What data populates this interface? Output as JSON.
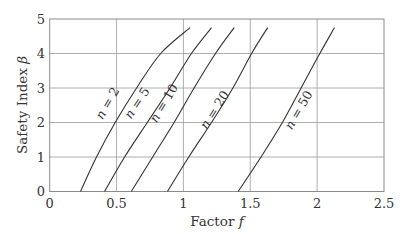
{
  "chart_data": {
    "type": "line",
    "title": "",
    "xlabel": "Factor f",
    "ylabel": "Safety Index β",
    "xlim": [
      0,
      2.5
    ],
    "ylim": [
      0,
      5
    ],
    "xticks": [
      0,
      0.5,
      1,
      1.5,
      2,
      2.5
    ],
    "xtick_labels": [
      "0",
      "0.5",
      "1",
      "1.5",
      "2",
      "2.5"
    ],
    "yticks": [
      0,
      1,
      2,
      3,
      4,
      5
    ],
    "ytick_labels": [
      "0",
      "1",
      "2",
      "3",
      "4",
      "5"
    ],
    "grid": true,
    "legend": "inline labels along curves",
    "beta": [
      0,
      1,
      2,
      3,
      4,
      4.75
    ],
    "series": [
      {
        "name": "n = 2",
        "f": [
          0.23,
          0.35,
          0.49,
          0.65,
          0.83,
          1.05
        ],
        "label_at": [
          0.46,
          2.5
        ]
      },
      {
        "name": "n = 5",
        "f": [
          0.41,
          0.56,
          0.73,
          0.9,
          1.06,
          1.21
        ],
        "label_at": [
          0.68,
          2.5
        ]
      },
      {
        "name": "n = 10",
        "f": [
          0.61,
          0.77,
          0.93,
          1.08,
          1.24,
          1.38
        ],
        "label_at": [
          0.88,
          2.5
        ]
      },
      {
        "name": "n = 20",
        "f": [
          0.88,
          1.04,
          1.21,
          1.37,
          1.51,
          1.63
        ],
        "label_at": [
          1.26,
          2.3
        ]
      },
      {
        "name": "n = 50",
        "f": [
          1.41,
          1.58,
          1.74,
          1.88,
          2.02,
          2.13
        ],
        "label_at": [
          1.89,
          2.3
        ]
      }
    ]
  }
}
